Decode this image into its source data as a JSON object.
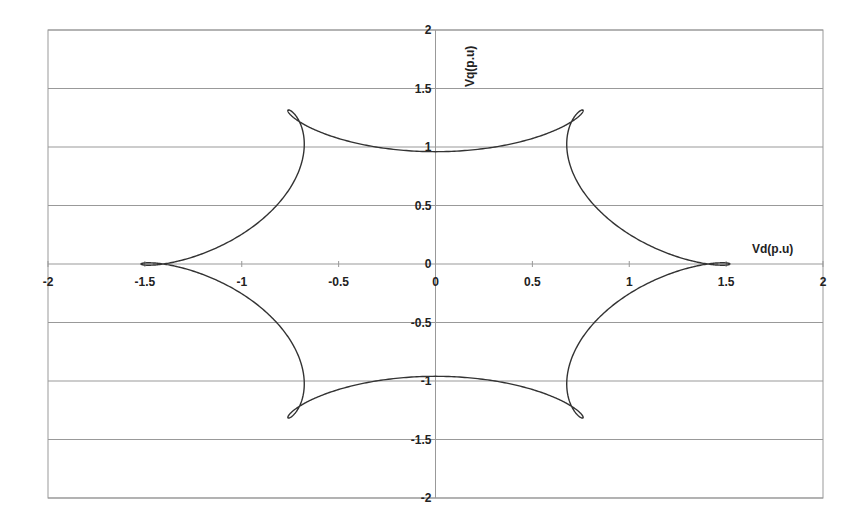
{
  "chart_data": {
    "type": "line",
    "title": "",
    "xlabel": "Vd(p.u)",
    "ylabel": "Vq(p.u)",
    "xlim": [
      -2,
      2
    ],
    "ylim": [
      -2,
      2
    ],
    "x_ticks": [
      "-2",
      "-1.5",
      "-1",
      "-0.5",
      "0",
      "0.5",
      "1",
      "1.5",
      "2"
    ],
    "y_ticks": [
      "2",
      "1.5",
      "1",
      "0.5",
      "0",
      "-0.5",
      "-1",
      "-1.5",
      "-2"
    ],
    "grid": {
      "horizontal": true,
      "vertical": false
    },
    "legend": null,
    "series": [
      {
        "name": "Vd-Vq trajectory",
        "description": "Six-lobed closed curve with six small inner loops (hypotrochoid-like)",
        "model": {
          "A": 1.24,
          "B": 0.28,
          "k": -5,
          "phase_deg": 0
        },
        "sample_points": [
          {
            "x": 1.52,
            "y": 0.0
          },
          {
            "x": 1.05,
            "y": 0.52
          },
          {
            "x": 0.85,
            "y": 0.42
          },
          {
            "x": 1.1,
            "y": 0.55
          },
          {
            "x": 0.5,
            "y": 1.38
          },
          {
            "x": 0.1,
            "y": 1.0
          },
          {
            "x": -0.35,
            "y": 1.45
          },
          {
            "x": -1.0,
            "y": 0.72
          },
          {
            "x": -0.8,
            "y": 0.55
          },
          {
            "x": -1.52,
            "y": 0.05
          },
          {
            "x": -1.0,
            "y": -0.52
          },
          {
            "x": -0.85,
            "y": -0.4
          },
          {
            "x": -1.15,
            "y": -0.55
          },
          {
            "x": -0.5,
            "y": -1.38
          },
          {
            "x": -0.1,
            "y": -1.0
          },
          {
            "x": 0.38,
            "y": -1.45
          },
          {
            "x": 1.0,
            "y": -0.72
          },
          {
            "x": 0.8,
            "y": -0.55
          }
        ]
      }
    ]
  },
  "colors": {
    "curve": "#333333",
    "grid": "#999999",
    "frame": "#999999",
    "text": "#222222"
  }
}
